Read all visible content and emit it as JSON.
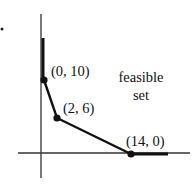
{
  "figure": {
    "type": "feasible-region-diagram",
    "region_label_line1": "feasible",
    "region_label_line2": "set",
    "vertices": [
      {
        "label": "(0, 10)",
        "x": 0,
        "y": 10
      },
      {
        "label": "(2, 6)",
        "x": 2,
        "y": 6
      },
      {
        "label": "(14, 0)",
        "x": 14,
        "y": 0
      }
    ],
    "colors": {
      "ink": "#111111",
      "axis": "#333333",
      "background": "#ffffff"
    }
  }
}
